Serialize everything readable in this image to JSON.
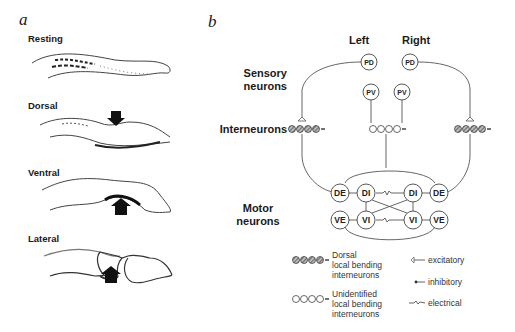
{
  "panel_a": {
    "letter": "a",
    "states": [
      {
        "label": "Resting"
      },
      {
        "label": "Dorsal"
      },
      {
        "label": "Ventral"
      },
      {
        "label": "Lateral"
      }
    ]
  },
  "panel_b": {
    "letter": "b",
    "columns": {
      "left": "Left",
      "right": "Right"
    },
    "rows": {
      "sensory": "Sensory neurons",
      "sensory_line1": "Sensory",
      "sensory_line2": "neurons",
      "interneurons": "Interneurons",
      "motor_line1": "Motor",
      "motor_line2": "neurons"
    },
    "nodes": {
      "pd_left": "PD",
      "pd_right": "PD",
      "pv_left": "PV",
      "pv_right": "PV",
      "de_left": "DE",
      "di_left": "DI",
      "di_right": "DI",
      "de_right": "DE",
      "ve_left": "VE",
      "vi_left": "VI",
      "vi_right": "VI",
      "ve_right": "VE"
    },
    "legend": {
      "dorsal_line1": "Dorsal",
      "dorsal_line2": "local bending",
      "dorsal_line3": "interneurons",
      "unid_line1": "Unidentified",
      "unid_line2": "local bending",
      "unid_line3": "interneurons",
      "excitatory": "excitatory",
      "inhibitory": "inhibitory",
      "electrical": "electrical"
    }
  }
}
